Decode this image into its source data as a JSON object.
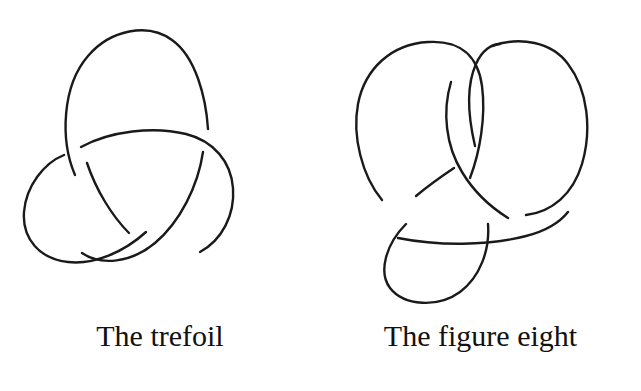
{
  "page": {
    "background_color": "#ffffff",
    "stroke_color": "#1a1a1a",
    "width": 641,
    "height": 391
  },
  "figures": [
    {
      "id": "trefoil",
      "caption": "The trefoil",
      "knot_name": "trefoil",
      "crossing_number": 3,
      "description": "Three-lobed knot diagram with three alternating crossings and three-fold rotational symmetry"
    },
    {
      "id": "figure-eight",
      "caption": "The figure eight",
      "knot_name": "figure eight",
      "crossing_number": 4,
      "description": "Knot diagram with two upper lobes and one lower lobe joined by four alternating crossings"
    }
  ],
  "captions": {
    "left": "The trefoil",
    "right": "The figure eight"
  }
}
